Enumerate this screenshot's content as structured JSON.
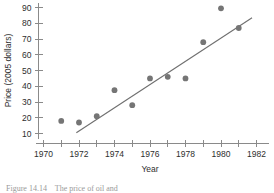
{
  "figure": {
    "caption": "Figure 14.14    The price of oil and",
    "caption_visible_note": "clipped at bottom edge"
  },
  "chart_data": {
    "type": "scatter",
    "title": "",
    "xlabel": "Year",
    "ylabel": "Price (2005 dollars)",
    "xlim": [
      1969.2,
      1982.6
    ],
    "ylim": [
      6,
      93
    ],
    "grid": false,
    "legend": null,
    "x_ticks_major": [
      1970,
      1972,
      1974,
      1976,
      1978,
      1980,
      1982
    ],
    "x_ticks_minor": [
      1971,
      1973,
      1975,
      1977,
      1979,
      1981
    ],
    "x_tick_labels": [
      "1970",
      "1972",
      "1974",
      "1976",
      "1978",
      "1980",
      "1982"
    ],
    "y_ticks": [
      10,
      20,
      30,
      40,
      50,
      60,
      70,
      80,
      90
    ],
    "y_tick_labels": [
      "10",
      "20",
      "30",
      "40",
      "50",
      "60",
      "70",
      "80",
      "90"
    ],
    "marker_color": "#757575",
    "line_color": "#6f6f6f",
    "axis_color": "#8a8a8a",
    "x": [
      1971,
      1972,
      1973,
      1974,
      1975,
      1976,
      1977,
      1978,
      1979,
      1980,
      1981
    ],
    "y": [
      18,
      17,
      21,
      37.5,
      28,
      45,
      46,
      45,
      68,
      89.5,
      77
    ],
    "points": [
      {
        "x": 1971,
        "y": 18
      },
      {
        "x": 1972,
        "y": 17
      },
      {
        "x": 1973,
        "y": 21
      },
      {
        "x": 1974,
        "y": 37.5
      },
      {
        "x": 1975,
        "y": 28
      },
      {
        "x": 1976,
        "y": 45
      },
      {
        "x": 1977,
        "y": 46
      },
      {
        "x": 1978,
        "y": 45
      },
      {
        "x": 1979,
        "y": 68
      },
      {
        "x": 1980,
        "y": 89.5
      },
      {
        "x": 1981,
        "y": 77
      }
    ],
    "trend_line": {
      "type": "linear-fit",
      "x_start": 1971.85,
      "y_start": 10.5,
      "x_end": 1981.75,
      "y_end": 83.5
    }
  }
}
